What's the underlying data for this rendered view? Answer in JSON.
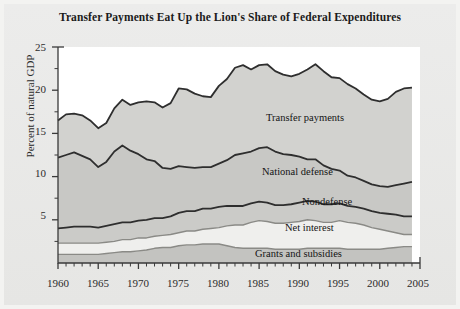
{
  "figure": {
    "title": "Transfer Payments Eat Up the Lion's Share of Federal Expenditures",
    "ylabel": "Percent of natural GDP"
  },
  "axis": {
    "y_ticks": [
      "5",
      "10",
      "15",
      "20",
      "25"
    ],
    "x_ticks": [
      "1960",
      "1965",
      "1970",
      "1975",
      "1980",
      "1985",
      "1990",
      "1995",
      "2000",
      "2005"
    ]
  },
  "series_labels": {
    "transfer": "Transfer payments",
    "defense": "National defense",
    "nondefense": "Nondefense",
    "interest": "Net interest",
    "grants": "Grants and subsidies"
  },
  "colors": {
    "band_grants": "#c3c3c0",
    "band_interest": "#efefed",
    "band_nondefense": "#cbcbc8",
    "band_defense": "#c8c8c5",
    "band_transfer": "#d2d2cf",
    "line_dark": "#2e2e2e",
    "line_mid": "#8a8a86",
    "plot_bg": "#ffffff",
    "page_bg": "#e9e9e7"
  },
  "chart_data": {
    "type": "area",
    "stacked": true,
    "title": "Transfer Payments Eat Up the Lion's Share of Federal Expenditures",
    "xlabel": "",
    "ylabel": "Percent of natural GDP",
    "xlim": [
      1960,
      2005
    ],
    "ylim": [
      0,
      25
    ],
    "grid": false,
    "legend": "inline-labels",
    "x": [
      1960,
      1961,
      1962,
      1963,
      1964,
      1965,
      1966,
      1967,
      1968,
      1969,
      1970,
      1971,
      1972,
      1973,
      1974,
      1975,
      1976,
      1977,
      1978,
      1979,
      1980,
      1981,
      1982,
      1983,
      1984,
      1985,
      1986,
      1987,
      1988,
      1989,
      1990,
      1991,
      1992,
      1993,
      1994,
      1995,
      1996,
      1997,
      1998,
      1999,
      2000,
      2001,
      2002,
      2003,
      2004
    ],
    "series": [
      {
        "name": "Grants and subsidies",
        "order": 1,
        "values": [
          1.0,
          1.0,
          1.0,
          1.0,
          1.0,
          1.0,
          1.1,
          1.2,
          1.3,
          1.3,
          1.4,
          1.5,
          1.7,
          1.8,
          1.8,
          2.0,
          2.1,
          2.1,
          2.2,
          2.2,
          2.2,
          2.0,
          1.8,
          1.7,
          1.7,
          1.7,
          1.7,
          1.6,
          1.6,
          1.6,
          1.6,
          1.7,
          1.7,
          1.7,
          1.7,
          1.7,
          1.6,
          1.6,
          1.6,
          1.6,
          1.6,
          1.7,
          1.8,
          1.9,
          1.9
        ]
      },
      {
        "name": "Net interest",
        "order": 2,
        "values": [
          1.3,
          1.3,
          1.3,
          1.3,
          1.3,
          1.3,
          1.3,
          1.3,
          1.4,
          1.4,
          1.5,
          1.4,
          1.4,
          1.4,
          1.5,
          1.5,
          1.6,
          1.6,
          1.7,
          1.8,
          1.9,
          2.3,
          2.6,
          2.7,
          3.0,
          3.2,
          3.1,
          3.0,
          3.0,
          3.1,
          3.2,
          3.3,
          3.2,
          3.0,
          3.0,
          3.2,
          3.1,
          3.0,
          2.8,
          2.5,
          2.3,
          2.0,
          1.7,
          1.4,
          1.4
        ]
      },
      {
        "name": "Nondefense",
        "order": 3,
        "values": [
          1.7,
          1.8,
          1.9,
          1.9,
          1.9,
          1.8,
          1.9,
          2.0,
          2.0,
          2.0,
          2.0,
          2.1,
          2.1,
          2.0,
          2.1,
          2.3,
          2.3,
          2.3,
          2.4,
          2.3,
          2.4,
          2.3,
          2.2,
          2.2,
          2.2,
          2.2,
          2.2,
          2.1,
          2.1,
          2.1,
          2.2,
          2.2,
          2.2,
          2.1,
          2.1,
          2.0,
          1.9,
          1.9,
          1.9,
          1.9,
          1.9,
          2.0,
          2.1,
          2.1,
          2.1
        ]
      },
      {
        "name": "National defense",
        "order": 4,
        "values": [
          8.2,
          8.4,
          8.6,
          8.2,
          7.8,
          7.0,
          7.4,
          8.4,
          8.9,
          8.3,
          7.7,
          7.0,
          6.6,
          5.8,
          5.5,
          5.4,
          5.1,
          5.0,
          4.8,
          4.8,
          5.0,
          5.3,
          5.9,
          6.1,
          6.0,
          6.2,
          6.4,
          6.2,
          5.9,
          5.7,
          5.3,
          4.8,
          4.9,
          4.5,
          4.1,
          3.8,
          3.5,
          3.4,
          3.2,
          3.1,
          3.1,
          3.1,
          3.4,
          3.8,
          4.0
        ]
      },
      {
        "name": "Transfer payments",
        "order": 5,
        "values": [
          4.3,
          4.7,
          4.5,
          4.7,
          4.5,
          4.5,
          4.5,
          5.0,
          5.3,
          5.3,
          6.0,
          6.7,
          6.8,
          7.0,
          7.6,
          9.0,
          9.0,
          8.6,
          8.2,
          8.1,
          9.0,
          9.4,
          10.1,
          10.2,
          9.5,
          9.6,
          9.6,
          9.3,
          9.2,
          9.1,
          9.6,
          10.4,
          11.0,
          10.9,
          10.6,
          10.7,
          10.6,
          10.3,
          10.0,
          9.8,
          9.8,
          10.2,
          10.8,
          11.0,
          10.9
        ]
      }
    ],
    "totals_note": "Top boundary is the sum of all five stacked bands (total federal expenditures as % of GDP), ranging about 16.5 in 1960 to a peak near 23.5 in the mid-1980s and early-1990s, ending near 20 in 2004."
  }
}
